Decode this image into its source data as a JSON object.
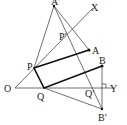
{
  "diagram": {
    "type": "geometry-reflection",
    "points": {
      "O": {
        "label": "O",
        "x": 15,
        "y": 88
      },
      "X": {
        "label": "X",
        "x": 93,
        "y": 8
      },
      "Y": {
        "label": "Y",
        "x": 115,
        "y": 88
      },
      "A": {
        "label": "A",
        "x": 89,
        "y": 50
      },
      "A_prime": {
        "label": "A′",
        "x": 54,
        "y": 6
      },
      "B": {
        "label": "B",
        "x": 102,
        "y": 66
      },
      "B_prime": {
        "label": "B′",
        "x": 102,
        "y": 109
      },
      "P": {
        "label": "P",
        "x": 34,
        "y": 68
      },
      "P_prime": {
        "label": "P′",
        "x": 67,
        "y": 37
      },
      "Q": {
        "label": "Q",
        "x": 44,
        "y": 88
      },
      "Q_prime": {
        "label": "Q′",
        "x": 99,
        "y": 88
      }
    },
    "colors": {
      "line": "#333333",
      "thick": "#111111",
      "background": "#ffffff"
    }
  }
}
